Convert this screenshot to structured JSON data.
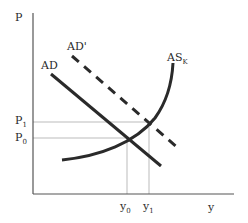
{
  "diagram": {
    "type": "AD-AS model",
    "axes": {
      "y_label": "P",
      "x_label": "y"
    },
    "curves": {
      "ad": {
        "label": "AD",
        "style": "solid"
      },
      "ad_prime": {
        "label": "AD'",
        "style": "dashed"
      },
      "as_k": {
        "label": "AS",
        "subscript": "K",
        "style": "solid"
      }
    },
    "price_levels": {
      "p1": {
        "label": "P",
        "subscript": "1"
      },
      "p0": {
        "label": "P",
        "subscript": "0"
      }
    },
    "output_levels": {
      "y0": {
        "label": "y",
        "subscript": "0"
      },
      "y1": {
        "label": "y",
        "subscript": "1"
      }
    },
    "colors": {
      "line": "#2a2a2a",
      "guide": "#aaaaaa",
      "background": "#ffffff"
    }
  }
}
